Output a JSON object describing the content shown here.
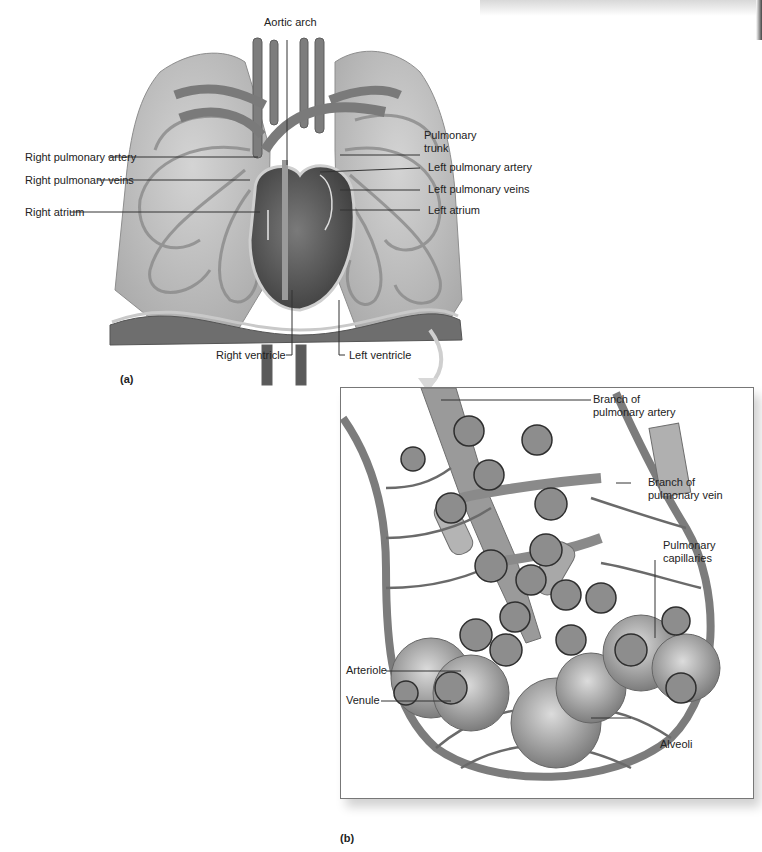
{
  "figure": {
    "panel_a": {
      "letter": "(a)",
      "labels": {
        "aortic_arch": "Aortic arch",
        "pulmonary_trunk_line1": "Pulmonary",
        "pulmonary_trunk_line2": "trunk",
        "right_pulmonary_artery": "Right pulmonary artery",
        "right_pulmonary_veins": "Right pulmonary veins",
        "right_atrium": "Right atrium",
        "left_pulmonary_artery": "Left pulmonary artery",
        "left_pulmonary_veins": "Left pulmonary veins",
        "left_atrium": "Left atrium",
        "right_ventricle": "Right ventricle",
        "left_ventricle": "Left ventricle"
      }
    },
    "panel_b": {
      "letter": "(b)",
      "labels": {
        "branch_artery_line1": "Branch of",
        "branch_artery_line2": "pulmonary artery",
        "branch_vein_line1": "Branch of",
        "branch_vein_line2": "pulmonary vein",
        "capillaries_line1": "Pulmonary",
        "capillaries_line2": "capillaries",
        "arteriole": "Arteriole",
        "venule": "Venule",
        "alveoli": "Alveoli"
      }
    },
    "colors": {
      "lung_fill": "#bdbdbd",
      "vessel": "#7a7a7a",
      "heart": "#555555",
      "diaphragm": "#6e6e6e",
      "inset_border": "#777777"
    }
  }
}
